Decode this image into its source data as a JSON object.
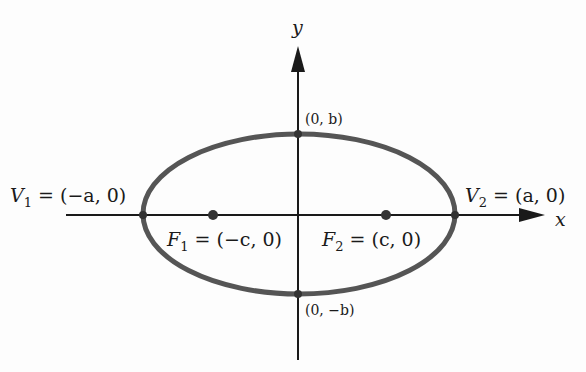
{
  "figure": {
    "axes": {
      "x_label": "x",
      "y_label": "y"
    },
    "points": {
      "v1": {
        "name": "V",
        "sub": "1",
        "rest": " = (−a, 0)"
      },
      "v2": {
        "name": "V",
        "sub": "2",
        "rest": " = (a, 0)"
      },
      "f1": {
        "name": "F",
        "sub": "1",
        "rest": " = (−c, 0)"
      },
      "f2": {
        "name": "F",
        "sub": "2",
        "rest": " = (c, 0)"
      },
      "top": "(0, b)",
      "bottom": "(0, −b)"
    },
    "colors": {
      "ellipse": "#555555",
      "axes": "#1a1a1a",
      "background": "#fdfdfd"
    }
  }
}
